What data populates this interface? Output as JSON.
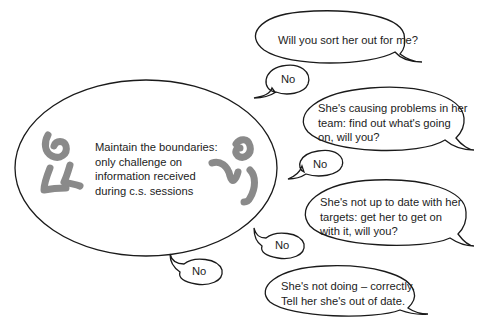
{
  "central": {
    "lines": [
      "Maintain the boundaries:",
      "only challenge on",
      "information received",
      "during c.s. sessions"
    ]
  },
  "requests": [
    {
      "lines": [
        "Will you sort her out for me?"
      ]
    },
    {
      "lines": [
        "She's causing problems in her",
        "team: find out what's going",
        "on, will you?"
      ]
    },
    {
      "lines": [
        "She's not up to date with her",
        "targets: get her to get on",
        "with it, will you?"
      ]
    },
    {
      "lines": [
        "She's not doing – correctly.",
        "Tell her she's out of date."
      ]
    }
  ],
  "replies": [
    {
      "label": "No"
    },
    {
      "label": "No"
    },
    {
      "label": "No"
    },
    {
      "label": "No"
    }
  ],
  "colors": {
    "figure": "#8a8a8a",
    "outline": "#1a1a1a",
    "text": "#1c1c1c"
  }
}
